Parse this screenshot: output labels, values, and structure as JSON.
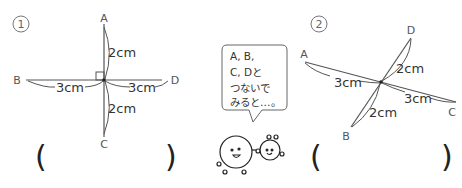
{
  "figure1": {
    "number": "1",
    "points": {
      "A": "A",
      "B": "B",
      "C": "C",
      "D": "D"
    },
    "measures": {
      "top": "2cm",
      "left": "3cm",
      "right": "3cm",
      "bottom": "2cm"
    },
    "right_angle_mark": true,
    "answer_open": "(",
    "answer_close": ")"
  },
  "figure2": {
    "number": "2",
    "points": {
      "A": "A",
      "B": "B",
      "C": "C",
      "D": "D"
    },
    "measures": {
      "upper": "2cm",
      "left": "3cm",
      "right": "3cm",
      "lower": "2cm"
    },
    "answer_open": "(",
    "answer_close": ")"
  },
  "speech_bubble": {
    "lines": [
      "A, B,",
      "C, Dと",
      "つないで",
      "みると…。"
    ]
  },
  "characters": {
    "icon": "smiling-ball-characters-icon"
  },
  "colors": {
    "line": "#555555",
    "text": "#333333",
    "background": "#ffffff"
  }
}
